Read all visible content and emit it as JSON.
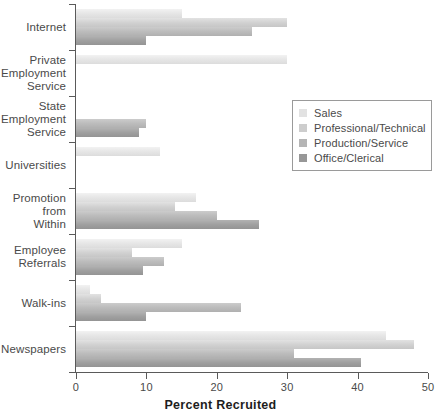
{
  "chart_data": {
    "type": "bar",
    "orientation": "horizontal",
    "title": "",
    "xlabel": "Percent Recruited",
    "ylabel": "",
    "xlim": [
      0,
      50
    ],
    "xticks": [
      0,
      10,
      20,
      30,
      40,
      50
    ],
    "xtick_labels": [
      "0",
      "10",
      "20",
      "30",
      "40",
      "50"
    ],
    "grid": false,
    "legend_position": "center-right",
    "categories": [
      "Internet",
      "Private Employment Service",
      "State Employment Service",
      "Universities",
      "Promotion from Within",
      "Employee Referrals",
      "Walk-ins",
      "Newspapers"
    ],
    "category_label_lines": [
      [
        "Internet"
      ],
      [
        "Private",
        "Employment",
        "Service"
      ],
      [
        "State",
        "Employment",
        "Service"
      ],
      [
        "Universities"
      ],
      [
        "Promotion",
        "from",
        "Within"
      ],
      [
        "Employee",
        "Referrals"
      ],
      [
        "Walk-ins"
      ],
      [
        "Newspapers"
      ]
    ],
    "series": [
      {
        "name": "Sales",
        "color": "#e2e2e2",
        "values": [
          15,
          30,
          0,
          12,
          17,
          15,
          2,
          44
        ]
      },
      {
        "name": "Professional/Technical",
        "color": "#cdcdcd",
        "values": [
          30,
          0,
          0,
          0,
          14,
          8,
          3.5,
          48
        ]
      },
      {
        "name": "Production/Service",
        "color": "#b5b5b5",
        "values": [
          25,
          0,
          10,
          0,
          20,
          12.5,
          23.5,
          31
        ]
      },
      {
        "name": "Office/Clerical",
        "color": "#979797",
        "values": [
          10,
          0,
          9,
          0,
          26,
          9.5,
          10,
          40.5
        ]
      }
    ]
  }
}
